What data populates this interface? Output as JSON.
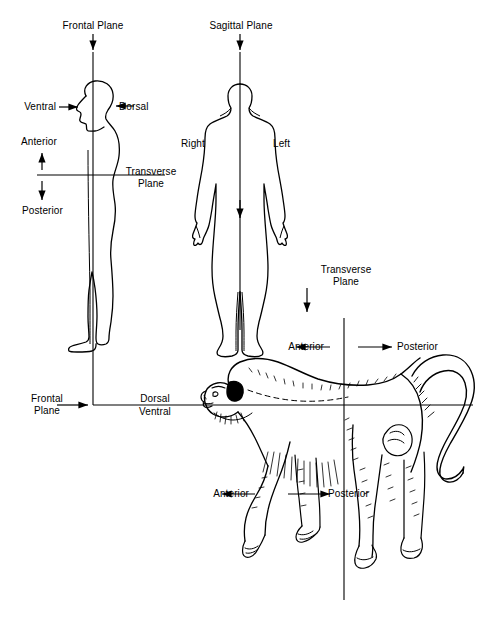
{
  "figure": {
    "background_color": "#ffffff",
    "line_color": "#000000",
    "width": 497,
    "height": 634
  },
  "panels": {
    "human_lateral": {
      "name": "Human lateral (side) view with frontal and transverse planes",
      "plane_label": "Frontal Plane",
      "labels": {
        "ventral": "Ventral",
        "dorsal": "Dorsal",
        "anterior": "Anterior",
        "posterior": "Posterior",
        "transverse_plane": "Transverse\nPlane",
        "transverse_plane_line1": "Transverse",
        "transverse_plane_line2": "Plane"
      }
    },
    "human_anterior": {
      "name": "Human anterior (front) view with sagittal plane",
      "plane_label": "Sagittal Plane",
      "labels": {
        "right": "Right",
        "left": "Left"
      }
    },
    "monkey": {
      "name": "Quadruped (monkey) lateral view with frontal and transverse planes",
      "labels": {
        "transverse_plane_line1": "Transverse",
        "transverse_plane_line2": "Plane",
        "frontal_plane_line1": "Frontal",
        "frontal_plane_line2": "Plane",
        "dorsal": "Dorsal",
        "ventral": "Ventral",
        "anterior_upper": "Anterior",
        "posterior_upper": "Posterior",
        "anterior_lower": "Anterior",
        "posterior_lower": "Posterior"
      }
    }
  },
  "icons": {
    "arrow_down": "arrow-down-icon",
    "arrow_up": "arrow-up-icon",
    "arrow_left": "arrow-left-icon",
    "arrow_right": "arrow-right-icon"
  }
}
